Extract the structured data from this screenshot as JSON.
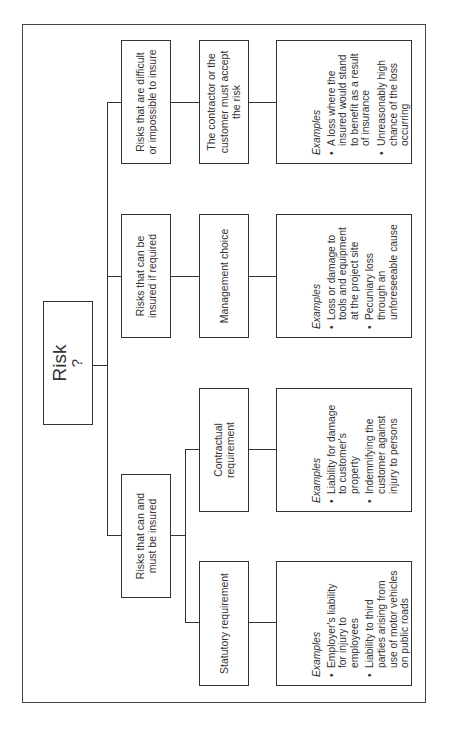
{
  "diagram": {
    "root": {
      "label": "Risk",
      "sub": "?"
    },
    "branches": [
      {
        "label": "Risks that are difficult or impossible to insure",
        "children": [
          {
            "label": "The contractor or the customer must accept the risk",
            "examples_title": "Examples",
            "examples": [
              "A loss where the insured would stand to benefit as a result of insurance",
              "Unreasonably high chance of the loss occurring"
            ]
          }
        ]
      },
      {
        "label": "Risks that can be insured if required",
        "children": [
          {
            "label": "Management choice",
            "examples_title": "Examples",
            "examples": [
              "Loss or damage to tools and equipment at the project site",
              "Pecuniary loss through an unforeseeable cause"
            ]
          }
        ]
      },
      {
        "label": "Risks that can and must be insured",
        "children": [
          {
            "label": "Contractual requirement",
            "examples_title": "Examples",
            "examples": [
              "Liability for damage to customer's property",
              "Indemnifying the customer against injury to persons"
            ]
          },
          {
            "label": "Statutory requirement",
            "examples_title": "Examples",
            "examples": [
              "Employer's liability for injury to employees",
              "Liability to third parties arising from use of motor vehicles on public roads"
            ]
          }
        ]
      }
    ],
    "colors": {
      "line": "#333333",
      "background": "#ffffff"
    }
  }
}
